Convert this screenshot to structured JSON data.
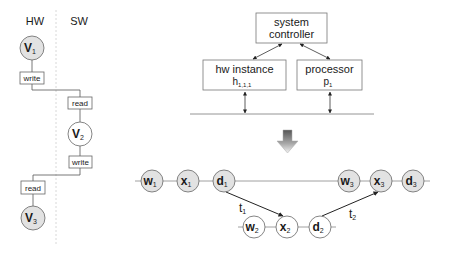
{
  "left_panel": {
    "hw_label": "HW",
    "sw_label": "SW",
    "nodes": [
      {
        "main": "V",
        "sub": "1",
        "side": "HW"
      },
      {
        "main": "V",
        "sub": "2",
        "side": "SW"
      },
      {
        "main": "V",
        "sub": "3",
        "side": "HW"
      }
    ],
    "ops": [
      {
        "label": "write",
        "side": "HW"
      },
      {
        "label": "read",
        "side": "SW"
      },
      {
        "label": "write",
        "side": "SW"
      },
      {
        "label": "read",
        "side": "HW"
      }
    ]
  },
  "architecture": {
    "controller": {
      "line1": "system",
      "line2": "controller"
    },
    "hw_instance": {
      "line1": "hw instance",
      "main": "h",
      "sub": "1,1,1"
    },
    "processor": {
      "line1": "processor",
      "main": "p",
      "sub": "1"
    }
  },
  "transform_arrow": "down-arrow",
  "schedule": {
    "top_row": [
      {
        "main": "w",
        "sub": "1"
      },
      {
        "main": "x",
        "sub": "1"
      },
      {
        "main": "d",
        "sub": "1"
      },
      {
        "main": "w",
        "sub": "3"
      },
      {
        "main": "x",
        "sub": "3"
      },
      {
        "main": "d",
        "sub": "3"
      }
    ],
    "bottom_row": [
      {
        "main": "w",
        "sub": "2"
      },
      {
        "main": "x",
        "sub": "2"
      },
      {
        "main": "d",
        "sub": "2"
      }
    ],
    "transfers": [
      {
        "main": "t",
        "sub": "1"
      },
      {
        "main": "t",
        "sub": "2"
      }
    ]
  },
  "colors": {
    "hw_node_fill": "#e2e2e2",
    "sw_node_fill": "#ffffff",
    "line": "#555555",
    "divider": "#d8d8d8"
  }
}
